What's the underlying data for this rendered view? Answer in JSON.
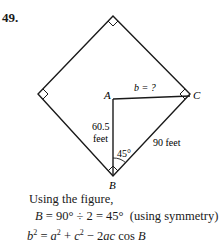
{
  "problem": {
    "number": "49."
  },
  "figure": {
    "labels": {
      "A": "A",
      "B": "B",
      "C": "C",
      "b_unknown": "b = ?",
      "side_a_value": "60.5",
      "side_a_unit": "feet",
      "side_c": "90 feet",
      "angle": "45°"
    }
  },
  "solution": {
    "intro": "Using the figure,",
    "step1": {
      "var": "B",
      "expr": " = 90° ÷ 2 = 45°",
      "note": "  (using symmetry)"
    },
    "step2": {
      "b": "b",
      "eq": " = ",
      "a": "a",
      "plus": " + ",
      "c": "c",
      "minus": " − 2",
      "ac": "ac",
      "cos": " cos ",
      "B": "B",
      "exp": "2"
    }
  }
}
